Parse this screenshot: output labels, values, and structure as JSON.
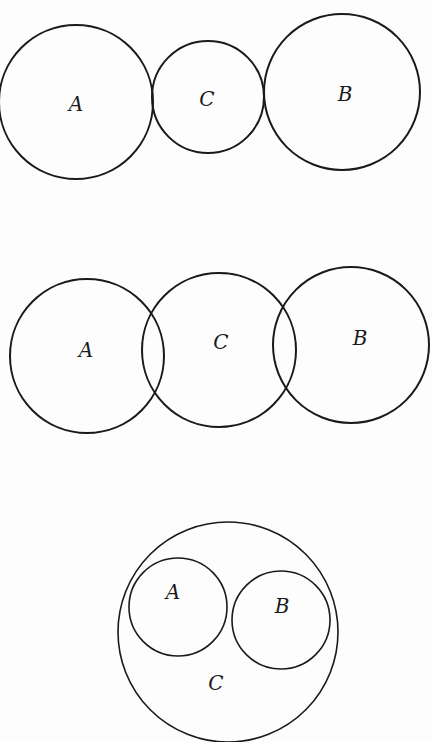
{
  "diagrams": [
    {
      "id": "tangent",
      "circles": [
        {
          "label": "A",
          "cx": 76,
          "cy": 102,
          "r": 77,
          "lx": 76,
          "ly": 105
        },
        {
          "label": "C",
          "cx": 208,
          "cy": 97,
          "r": 56,
          "lx": 207,
          "ly": 100
        },
        {
          "label": "B",
          "cx": 342,
          "cy": 92,
          "r": 78,
          "lx": 345,
          "ly": 95
        }
      ]
    },
    {
      "id": "overlapping",
      "circles": [
        {
          "label": "A",
          "cx": 87,
          "cy": 356,
          "r": 77,
          "lx": 86,
          "ly": 351
        },
        {
          "label": "C",
          "cx": 219,
          "cy": 350,
          "r": 77,
          "lx": 221,
          "ly": 343
        },
        {
          "label": "B",
          "cx": 351,
          "cy": 345,
          "r": 78,
          "lx": 360,
          "ly": 339
        }
      ]
    },
    {
      "id": "contained",
      "circles": [
        {
          "label": "C",
          "cx": 228,
          "cy": 632,
          "r": 110,
          "lx": 216,
          "ly": 684
        },
        {
          "label": "A",
          "cx": 178,
          "cy": 607,
          "r": 49,
          "lx": 173,
          "ly": 593
        },
        {
          "label": "B",
          "cx": 281,
          "cy": 620,
          "r": 49,
          "lx": 282,
          "ly": 607
        }
      ]
    }
  ]
}
